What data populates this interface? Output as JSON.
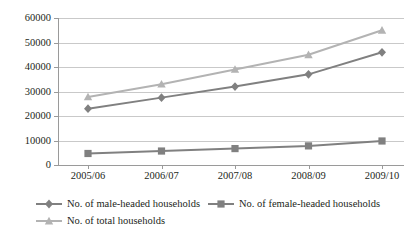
{
  "chart_data": {
    "type": "line",
    "title": "",
    "xlabel": "",
    "ylabel": "",
    "categories": [
      "2005/06",
      "2006/07",
      "2007/08",
      "2008/09",
      "2009/10"
    ],
    "ylim": [
      0,
      60000
    ],
    "ytick_labels": [
      "0",
      "10000",
      "20000",
      "30000",
      "40000",
      "50000",
      "60000"
    ],
    "ytick_values": [
      0,
      10000,
      20000,
      30000,
      40000,
      50000,
      60000
    ],
    "grid": true,
    "legend_position": "bottom",
    "series": [
      {
        "name": "No. of male-headed households",
        "marker": "diamond",
        "color": "#808080",
        "values": [
          23000,
          27500,
          32000,
          37000,
          46000
        ]
      },
      {
        "name": "No. of female-headed households",
        "marker": "square",
        "color": "#808080",
        "values": [
          4700,
          5700,
          6700,
          7800,
          9800
        ]
      },
      {
        "name": "No. of total households",
        "marker": "triangle",
        "color": "#b3b3b3",
        "values": [
          27800,
          33000,
          39000,
          45000,
          55000
        ]
      }
    ]
  },
  "legend": {
    "items": [
      {
        "label": "No. of male-headed households"
      },
      {
        "label": "No. of female-headed households"
      },
      {
        "label": "No. of total households"
      }
    ]
  },
  "colors": {
    "series_male": "#808080",
    "series_female": "#808080",
    "series_total": "#b3b3b3",
    "gridline": "#c9c9c9",
    "axis": "#9a9a9a",
    "text": "#231f20"
  }
}
